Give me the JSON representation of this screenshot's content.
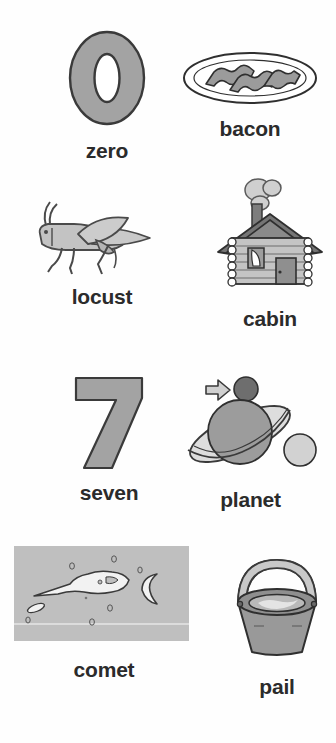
{
  "page": {
    "background_color": "#ffffff",
    "label_color": "#2b2b2b",
    "figure_fill": "#a8a8a8",
    "figure_light_fill": "#d4d4d4",
    "figure_dark_fill": "#6e6e6e",
    "outline_color": "#333333"
  },
  "cards": [
    {
      "id": "zero",
      "label": "zero",
      "icon": "numeral-zero-icon",
      "glyph": "0",
      "kind": "numeral",
      "row": 1,
      "column": 1
    },
    {
      "id": "bacon",
      "label": "bacon",
      "icon": "bacon-plate-icon",
      "kind": "illustration",
      "row": 1,
      "column": 2
    },
    {
      "id": "locust",
      "label": "locust",
      "icon": "locust-icon",
      "kind": "illustration",
      "row": 2,
      "column": 1
    },
    {
      "id": "cabin",
      "label": "cabin",
      "icon": "log-cabin-icon",
      "kind": "illustration",
      "row": 2,
      "column": 2
    },
    {
      "id": "seven",
      "label": "seven",
      "icon": "numeral-seven-icon",
      "glyph": "7",
      "kind": "numeral",
      "row": 3,
      "column": 1
    },
    {
      "id": "planet",
      "label": "planet",
      "icon": "planet-with-ring-icon",
      "kind": "illustration",
      "row": 3,
      "column": 2
    },
    {
      "id": "comet",
      "label": "comet",
      "icon": "comet-night-sky-icon",
      "kind": "illustration",
      "row": 4,
      "column": 1
    },
    {
      "id": "pail",
      "label": "pail",
      "icon": "pail-bucket-icon",
      "kind": "illustration",
      "row": 4,
      "column": 2
    }
  ]
}
